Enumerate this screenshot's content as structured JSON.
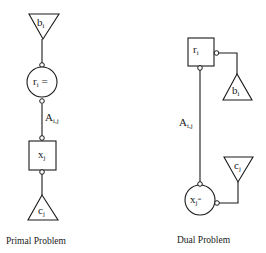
{
  "primal": {
    "caption": "Primal Problem",
    "b_node": {
      "base": "b",
      "sub": "i",
      "shape": "triangle-down"
    },
    "r_node": {
      "base": "r",
      "sub": "i",
      "suffix": " =",
      "shape": "circle"
    },
    "edge_label": {
      "base": "A",
      "sub": "i,j"
    },
    "x_node": {
      "base": "x",
      "sub": "j",
      "shape": "square"
    },
    "c_node": {
      "base": "c",
      "sub": "j",
      "shape": "triangle-up"
    }
  },
  "dual": {
    "caption": "Dual Problem",
    "r_node": {
      "base": "r",
      "sub": "i",
      "shape": "square"
    },
    "b_node": {
      "base": "b",
      "sub": "i",
      "shape": "triangle-up"
    },
    "edge_label": {
      "base": "A",
      "sub": "i,j"
    },
    "c_node": {
      "base": "c",
      "sub": "j",
      "shape": "triangle-down"
    },
    "x_node": {
      "base": "x",
      "sub": "j",
      "suffix": "=",
      "shape": "circle"
    }
  },
  "colors": {
    "ink": "#1a1a1a",
    "background": "#ffffff"
  }
}
